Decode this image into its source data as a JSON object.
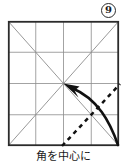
{
  "step": {
    "badge_number": "9",
    "caption": "角を中心に"
  },
  "colors": {
    "outline": "#2b2b2b",
    "crease": "#8c8c8c",
    "fold_line": "#111111",
    "arrow": "#111111",
    "background": "#ffffff",
    "text": "#1a1a1a"
  },
  "diagram": {
    "type": "origami-step",
    "shape": "square",
    "square": {
      "x": 8,
      "y": 21,
      "width": 111,
      "height": 125
    },
    "grid": {
      "columns": 4,
      "rows": 4,
      "vertical_fractions": [
        0.25,
        0.5,
        0.75
      ],
      "horizontal_fractions": [
        0.25,
        0.5,
        0.75
      ],
      "style": "thin-gray-crease"
    },
    "diagonals": [
      {
        "name": "diagonal-tl-br",
        "from": "top-left",
        "to": "bottom-right"
      },
      {
        "name": "diagonal-tr-bl",
        "from": "top-right",
        "to": "bottom-left"
      }
    ],
    "fold_line": {
      "style": "dashed",
      "from": {
        "x": 62,
        "y": 146
      },
      "to": {
        "x": 119,
        "y": 85
      },
      "dash_pattern": "4 4",
      "width": 2.4
    },
    "arrow": {
      "name": "fold-arrow",
      "style": "curved-solid",
      "start": {
        "x": 117,
        "y": 143
      },
      "control": {
        "x": 104,
        "y": 100
      },
      "end": {
        "x": 70,
        "y": 87
      },
      "head_tip": {
        "x": 64,
        "y": 83
      },
      "direction": "up-left-to-center",
      "meaning": "fold corner to center"
    },
    "center_point": {
      "x": 63.5,
      "y": 83.5
    }
  }
}
